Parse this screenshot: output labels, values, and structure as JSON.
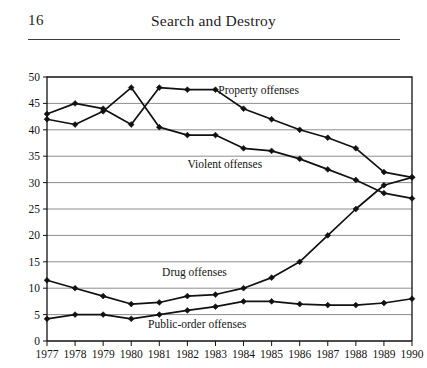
{
  "page": {
    "folio": "16",
    "running_head": "Search and Destroy"
  },
  "chart_data": {
    "type": "line",
    "title": "",
    "xlabel": "",
    "ylabel": "",
    "xlim": [
      1977,
      1990
    ],
    "ylim": [
      0,
      50
    ],
    "ytick_step": 5,
    "grid": true,
    "grid_axis": "y",
    "legend": "inline-annotations",
    "marker": "diamond",
    "line_color": "#111111",
    "grid_color": "#8e8e8e",
    "frame_color": "#111111",
    "categories": [
      1977,
      1978,
      1979,
      1980,
      1981,
      1982,
      1983,
      1984,
      1985,
      1986,
      1987,
      1988,
      1989,
      1990
    ],
    "xtick_labels": [
      "1977",
      "1978",
      "1979",
      "1980",
      "1981",
      "1982",
      "1983",
      "1984",
      "1985",
      "1986",
      "1987",
      "1988",
      "1989",
      "1990"
    ],
    "ytick_labels": [
      "0",
      "5",
      "10",
      "15",
      "20",
      "25",
      "30",
      "35",
      "40",
      "45",
      "50"
    ],
    "series": [
      {
        "name": "Property offenses",
        "label": "Property offenses",
        "label_x": 1983.1,
        "label_y": 47.6,
        "values": [
          43.0,
          45.0,
          44.0,
          41.0,
          48.0,
          47.6,
          47.6,
          44.0,
          42.0,
          40.0,
          38.5,
          36.5,
          32.0,
          31.0
        ]
      },
      {
        "name": "Violent offenses",
        "label": "Violent offenses",
        "label_x": 1982.0,
        "label_y": 33.6,
        "values": [
          42.0,
          41.0,
          43.5,
          48.0,
          40.5,
          39.0,
          39.0,
          36.5,
          36.0,
          34.5,
          32.5,
          30.5,
          28.0,
          27.0
        ]
      },
      {
        "name": "Drug offenses",
        "label": "Drug offenses",
        "label_x": 1981.1,
        "label_y": 13.1,
        "values": [
          11.5,
          10.0,
          8.5,
          7.0,
          7.3,
          8.5,
          8.8,
          10.0,
          12.0,
          15.0,
          20.0,
          25.0,
          29.5,
          31.0
        ]
      },
      {
        "name": "Public-order offenses",
        "label": "Public-order offenses",
        "label_x": 1980.6,
        "label_y": 3.2,
        "values": [
          4.2,
          5.0,
          5.0,
          4.2,
          5.0,
          5.8,
          6.5,
          7.5,
          7.5,
          7.0,
          6.8,
          6.8,
          7.2,
          8.0
        ]
      }
    ]
  }
}
